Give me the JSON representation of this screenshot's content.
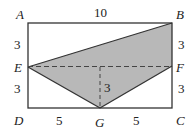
{
  "figure": {
    "type": "geometry-diagram",
    "rectangle": [
      "A",
      "B",
      "C",
      "D"
    ],
    "shaded_polygon": [
      "E",
      "B",
      "F",
      "G"
    ],
    "fill_color": "#b8b8b8",
    "stroke_color": "#333333",
    "points": {
      "A": {
        "label": "A",
        "x": 28,
        "y": 23
      },
      "B": {
        "label": "B",
        "x": 172,
        "y": 23
      },
      "C": {
        "label": "C",
        "x": 172,
        "y": 108
      },
      "D": {
        "label": "D",
        "x": 28,
        "y": 108
      },
      "E": {
        "label": "E",
        "x": 28,
        "y": 67
      },
      "F": {
        "label": "F",
        "x": 172,
        "y": 66
      },
      "G": {
        "label": "G",
        "x": 100,
        "y": 108
      }
    },
    "measurements": {
      "AB": "10",
      "AE": "3",
      "ED": "3",
      "BF": "3",
      "FC": "3",
      "DG": "5",
      "GC": "5",
      "height_to_G": "3"
    },
    "dashed_lines": [
      "E-F",
      "perpendicular-to-G"
    ]
  }
}
